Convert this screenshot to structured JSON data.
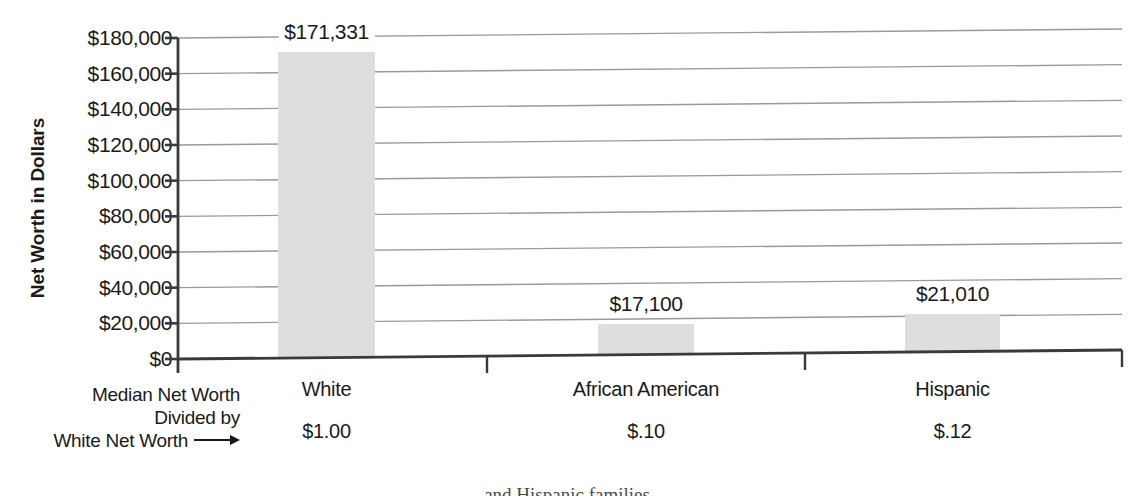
{
  "chart_data": {
    "type": "bar",
    "title": "",
    "xlabel": "",
    "ylabel": "Net Worth in Dollars",
    "categories": [
      "White",
      "African American",
      "Hispanic"
    ],
    "values": [
      171331,
      17100,
      21010
    ],
    "value_labels": [
      "$171,331",
      "$17,100",
      "$21,010"
    ],
    "ratio_row_label": [
      "Median Net Worth",
      "Divided by",
      "White Net Worth"
    ],
    "ratio_values": [
      "$1.00",
      "$.10",
      "$.12"
    ],
    "ylim": [
      0,
      180000
    ],
    "ytick_values": [
      0,
      20000,
      40000,
      60000,
      80000,
      100000,
      120000,
      140000,
      160000,
      180000
    ],
    "ytick_labels": [
      "$0",
      "$20,000",
      "$40,000",
      "$60,000",
      "$80,000",
      "$100,000",
      "$120,000",
      "$140,000",
      "$160,000",
      "$180,000"
    ],
    "grid": true,
    "legend": "none",
    "bar_color": "#dedede",
    "axis_color": "#3a3a3a",
    "grid_color": "#9a9a9a"
  },
  "caption": {
    "clipped_text": "and Hispanic families"
  }
}
